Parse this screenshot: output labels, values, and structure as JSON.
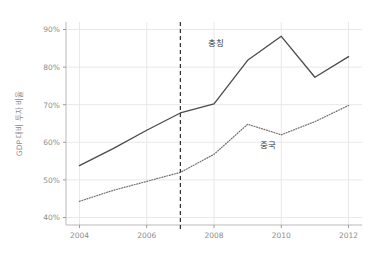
{
  "chart_data": {
    "type": "line",
    "title": "",
    "xlabel": "",
    "ylabel": "GDP 대비 투자 비율",
    "xlim": [
      2003.6,
      2012.4
    ],
    "ylim": [
      38,
      92
    ],
    "xticks": [
      "2004",
      "2006",
      "2008",
      "2010",
      "2012"
    ],
    "xtick_values": [
      2004,
      2006,
      2008,
      2010,
      2012
    ],
    "yticks": [
      "40%",
      "50%",
      "60%",
      "70%",
      "80%",
      "90%"
    ],
    "ytick_values": [
      40,
      50,
      60,
      70,
      80,
      90
    ],
    "grid": true,
    "legend_position": "inline-annotation",
    "x": [
      2004,
      2005,
      2006,
      2007,
      2008,
      2009,
      2010,
      2011,
      2012
    ],
    "series": [
      {
        "name": "충칭",
        "style": "solid",
        "color": "#4a4a4a",
        "label_x": 2008.05,
        "label_y": 85.5,
        "values": [
          53.8,
          58.3,
          63.2,
          67.8,
          70.2,
          81.8,
          88.2,
          77.3,
          82.8
        ]
      },
      {
        "name": "중국",
        "style": "dotted",
        "color": "#6f6f6f",
        "label_x": 2009.6,
        "label_y": 58.5,
        "values": [
          44.3,
          47.2,
          49.6,
          52.0,
          56.8,
          64.8,
          62.0,
          65.5,
          69.8
        ]
      }
    ],
    "annotations": [
      {
        "type": "vertical-line",
        "name": "year-2007-marker",
        "x": 2007,
        "style": "dashed",
        "color": "#2b2b2b"
      }
    ]
  }
}
